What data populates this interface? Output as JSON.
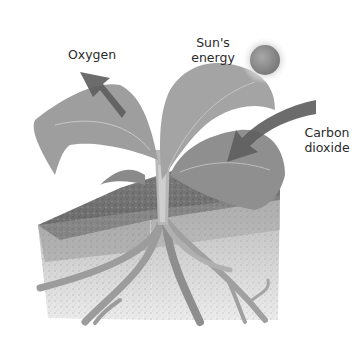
{
  "diagram": {
    "labels": {
      "oxygen": "Oxygen",
      "sun_line1": "Sun's",
      "sun_line2": "energy",
      "co2_line1": "Carbon",
      "co2_line2": "dioxide"
    },
    "elements": [
      "plant-leaves",
      "stem",
      "soil-block",
      "roots",
      "sun",
      "oxygen-arrow",
      "carbon-dioxide-arrow"
    ],
    "colors": {
      "leaf": "#9a9a9a",
      "leaf_dark": "#7d7d7d",
      "soil": "#6e6e6e",
      "soil_light": "#cfcfcf",
      "arrow": "#666666",
      "sun": "#8a8a8a",
      "sun_glow": "#d6d6d6",
      "root": "#a8a8a8"
    }
  }
}
